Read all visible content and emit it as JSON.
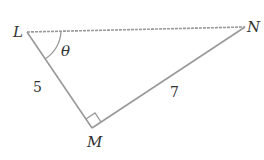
{
  "diagram": {
    "type": "right-triangle",
    "vertices": {
      "L": {
        "label": "L",
        "x": 27,
        "y": 32
      },
      "N": {
        "label": "N",
        "x": 245,
        "y": 27
      },
      "M": {
        "label": "M",
        "x": 92,
        "y": 128
      }
    },
    "sides": {
      "LM": {
        "label": "5"
      },
      "MN": {
        "label": "7"
      }
    },
    "angle_label": "θ",
    "right_angle_at": "M",
    "line_color": "#999999",
    "text_color": "#333333"
  }
}
